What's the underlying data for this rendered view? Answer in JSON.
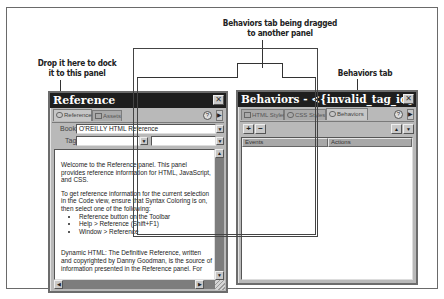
{
  "callouts": {
    "drop_here": [
      "Drop it here to dock",
      "it to this panel"
    ],
    "dragging": [
      "Behaviors tab being dragged",
      "to another panel"
    ],
    "behaviors_tab": "Behaviors tab"
  },
  "reference_panel": {
    "title": "Reference",
    "close_glyph": "✕",
    "tabs": [
      {
        "label": "Reference",
        "icon": "reference-icon",
        "active": true
      },
      {
        "label": "Assets",
        "icon": "assets-icon",
        "active": false
      }
    ],
    "help_glyph": "?",
    "menu_glyph": "▶",
    "book_label": "Book:",
    "book_value": "O'REILLY HTML Reference",
    "tag_label": "Tag:",
    "tag_value": "",
    "attribute_value": "",
    "dropdown_glyph": "▼",
    "content": {
      "para1": "Welcome to the Reference panel. This panel provides reference information for HTML, JavaScript, and CSS.",
      "para2": "To get reference information for the current selection in the Code view, ensure that Syntax Coloring is on, then select one of the following:",
      "bullets": [
        "Reference button on the Toolbar",
        "Help > Reference (Shift+F1)",
        "Window > Reference"
      ],
      "para3": "Dynamic HTML: The Definitive Reference, written and copyrighted by Danny Goodman, is the source of information presented in the Reference panel. For"
    },
    "scroll_up": "▲",
    "scroll_down": "▼",
    "scroll_left": "◀",
    "scroll_right": "▶"
  },
  "behaviors_panel": {
    "title": "Behaviors - <{invalid_tag_id} > Actions",
    "close_glyph": "✕",
    "tabs": [
      {
        "label": "HTML Styles",
        "icon": "html-styles-icon",
        "active": false
      },
      {
        "label": "CSS Styles",
        "icon": "css-styles-icon",
        "active": false
      },
      {
        "label": "Behaviors",
        "icon": "behaviors-icon",
        "active": true
      }
    ],
    "help_glyph": "?",
    "menu_glyph": "▶",
    "add_glyph": "+",
    "remove_glyph": "−",
    "up_glyph": "▲",
    "down_glyph": "▼",
    "columns": [
      "Events",
      "Actions"
    ]
  }
}
